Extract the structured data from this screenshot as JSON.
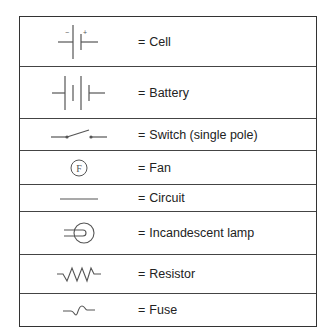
{
  "legend": {
    "title": "",
    "rows": [
      {
        "symbol": "cell-icon",
        "label": "Cell"
      },
      {
        "symbol": "battery-icon",
        "label": "Battery"
      },
      {
        "symbol": "switch-icon",
        "label": "Switch (single pole)"
      },
      {
        "symbol": "fan-icon",
        "label": "Fan"
      },
      {
        "symbol": "circuit-icon",
        "label": "Circuit"
      },
      {
        "symbol": "lamp-icon",
        "label": "Incandescent lamp"
      },
      {
        "symbol": "resistor-icon",
        "label": "Resistor"
      },
      {
        "symbol": "fuse-icon",
        "label": "Fuse"
      }
    ],
    "equals": "=",
    "cell_minus": "−",
    "cell_plus": "+",
    "fan_letter": "F"
  },
  "colors": {
    "line": "#555555",
    "border": "#333333",
    "text": "#222222"
  }
}
